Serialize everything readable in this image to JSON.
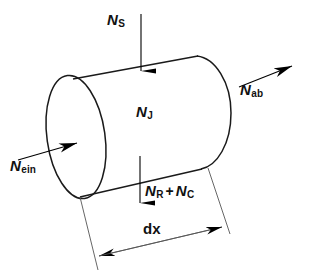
{
  "figure": {
    "background_color": "#ffffff",
    "line_color": "#1a1a1a",
    "arrow_color": "#000000",
    "dimension_line_color": "#555555"
  },
  "labels": {
    "incoming_flux": {
      "symbol": "N",
      "subscript": "ein",
      "full": "N_ein"
    },
    "outgoing_flux": {
      "symbol": "N",
      "subscript": "ab",
      "full": "N_ab"
    },
    "solar_flux": {
      "symbol": "N",
      "subscript": "S",
      "full": "N_S"
    },
    "internal_flux": {
      "symbol": "N",
      "subscript": "J",
      "full": "N_J"
    },
    "loss_first": {
      "symbol": "N",
      "subscript": "R",
      "full": "N_R"
    },
    "loss_operator": "+",
    "loss_second": {
      "symbol": "N",
      "subscript": "C",
      "full": "N_C"
    },
    "length_dimension": "dx"
  },
  "arrows": {
    "solar": {
      "name": "N_S",
      "direction": "down",
      "position": "top"
    },
    "incoming": {
      "name": "N_ein",
      "direction": "up-right",
      "position": "left-face"
    },
    "outgoing": {
      "name": "N_ab",
      "direction": "up-right",
      "position": "right-end"
    },
    "losses": {
      "name": "N_R + N_C",
      "direction": "down",
      "position": "bottom"
    },
    "dimension": {
      "name": "dx",
      "direction": "double-headed",
      "position": "below"
    }
  }
}
